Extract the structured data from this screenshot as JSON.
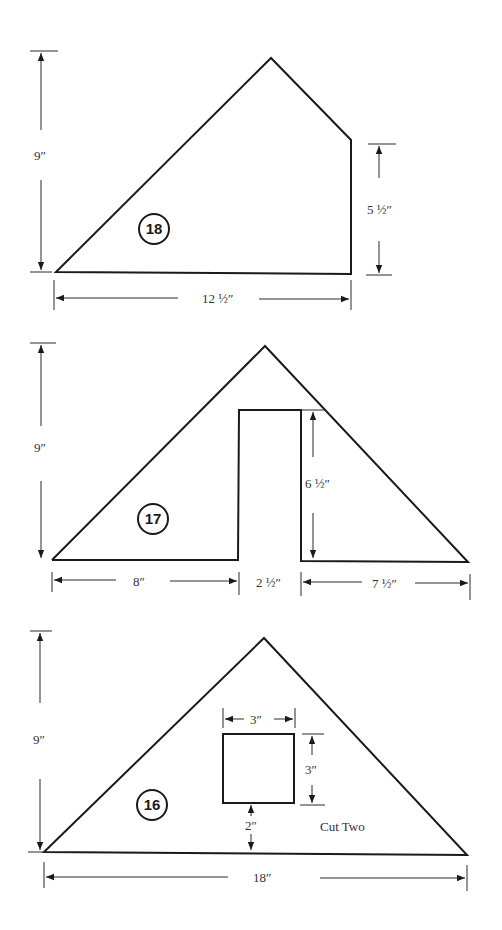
{
  "pieces": [
    {
      "id": "18",
      "label": "18",
      "dimensions": {
        "height": "9″",
        "right_height": "5 ½″",
        "width": "12 ½″"
      }
    },
    {
      "id": "17",
      "label": "17",
      "dimensions": {
        "height": "9″",
        "notch_height": "6 ½″",
        "left_base": "8″",
        "notch_width": "2 ½″",
        "right_base": "7 ½″"
      }
    },
    {
      "id": "16",
      "label": "16",
      "note": "Cut Two",
      "dimensions": {
        "height": "9″",
        "window_width": "3″",
        "window_height": "3″",
        "window_offset": "2″",
        "base": "18″"
      }
    }
  ]
}
